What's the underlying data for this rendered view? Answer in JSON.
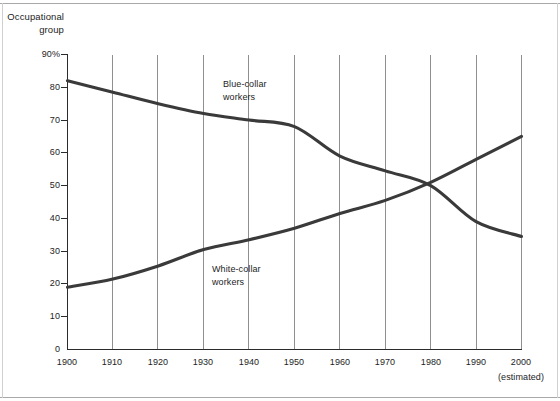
{
  "chart_data": {
    "type": "line",
    "title": "",
    "ylabel": "Occupational group",
    "xlabel": "",
    "ylim": [
      0,
      90
    ],
    "xlim": [
      1900,
      2000
    ],
    "grid": "vertical",
    "legend_position": "inline-annotations",
    "y_tick_labels": [
      "90%",
      "80",
      "70",
      "60",
      "50",
      "40",
      "30",
      "20",
      "10",
      "0"
    ],
    "y_ticks": [
      90,
      80,
      70,
      60,
      50,
      40,
      30,
      20,
      10,
      0
    ],
    "x_tick_labels": [
      "1900",
      "1910",
      "1920",
      "1930",
      "1940",
      "1950",
      "1960",
      "1970",
      "1980",
      "1990",
      "2000"
    ],
    "x": [
      1900,
      1910,
      1920,
      1930,
      1940,
      1950,
      1960,
      1970,
      1980,
      1990,
      2000
    ],
    "x_note": "(estimated)",
    "annotations": [
      {
        "text": "Blue-collar workers",
        "line1": "Blue-collar",
        "line2": "workers"
      },
      {
        "text": "White-collar workers",
        "line1": "White-collar",
        "line2": "workers"
      }
    ],
    "series": [
      {
        "name": "Blue-collar workers",
        "color": "#3a3a3a",
        "values": [
          82,
          78.5,
          75,
          72,
          70,
          68,
          59,
          54.5,
          50,
          39,
          34.5
        ]
      },
      {
        "name": "White-collar workers",
        "color": "#3a3a3a",
        "values": [
          19,
          21.5,
          25.5,
          30.5,
          33.5,
          37,
          41.5,
          45.5,
          51,
          58,
          65
        ]
      }
    ],
    "crossover": {
      "year": 1976,
      "value": 50
    }
  },
  "axis": {
    "y_title_line1": "Occupational",
    "y_title_line2": "group"
  },
  "colors": {
    "line": "#3a3a3a",
    "axis": "#2b2b2b",
    "gridline": "#8f8f8f",
    "text": "#1d1d1d",
    "background": "#ffffff"
  }
}
